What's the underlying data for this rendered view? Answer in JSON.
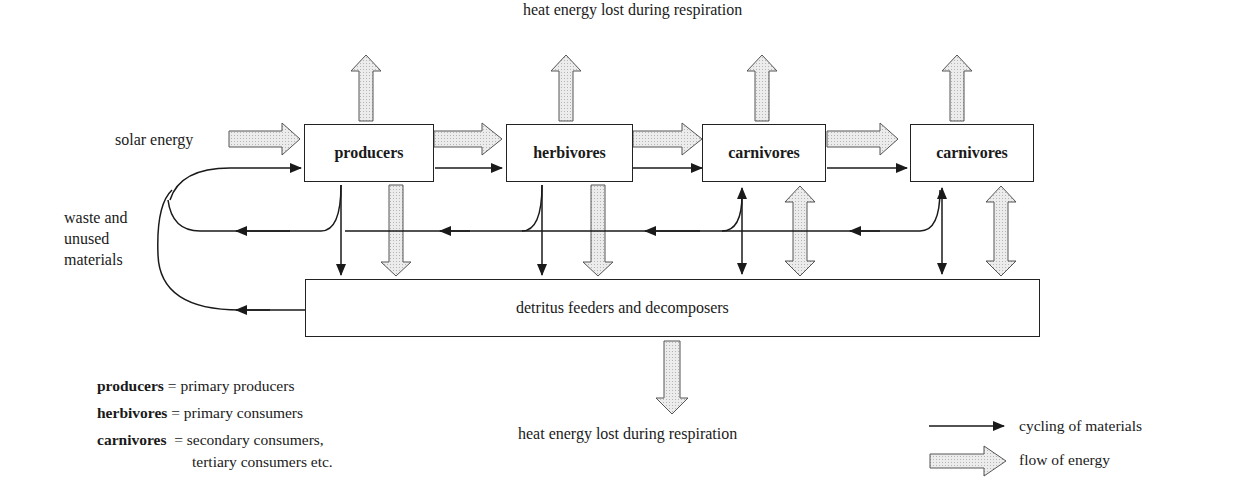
{
  "diagram": {
    "title_top": "heat energy lost during respiration",
    "title_bottom": "heat energy lost during respiration",
    "input_label": "solar energy",
    "loop_label": [
      "waste and",
      "unused",
      "materials"
    ],
    "boxes": [
      {
        "id": "producers",
        "label": "producers"
      },
      {
        "id": "herbivores",
        "label": "herbivores"
      },
      {
        "id": "carnivores-1",
        "label": "carnivores"
      },
      {
        "id": "carnivores-2",
        "label": "carnivores"
      },
      {
        "id": "detritus",
        "label": "detritus feeders and decomposers"
      }
    ],
    "definitions": [
      {
        "term": "producers",
        "sep": "=",
        "meaning": "primary producers"
      },
      {
        "term": "herbivores",
        "sep": "=",
        "meaning": "primary consumers"
      },
      {
        "term": "carnivores",
        "sep": "=",
        "meaning": "secondary consumers,",
        "meaning2": "tertiary consumers etc."
      }
    ],
    "legend": [
      {
        "icon": "thin-black-arrow",
        "label": "cycling of materials"
      },
      {
        "icon": "hollow-shaded-arrow",
        "label": "flow of energy"
      }
    ],
    "colors": {
      "line": "#1a1a1a",
      "energy_fill": "#e6e6e6",
      "energy_stroke": "#555555"
    }
  }
}
